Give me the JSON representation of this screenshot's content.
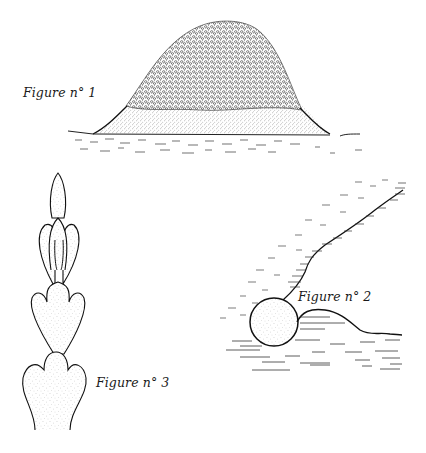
{
  "figures": [
    {
      "id": "fig1",
      "label": "Figure n° 1",
      "subject": "mound"
    },
    {
      "id": "fig2",
      "label": "Figure n° 2",
      "subject": "boulder-on-slope"
    },
    {
      "id": "fig3",
      "label": "Figure n° 3",
      "subject": "stacked-lobes"
    }
  ],
  "colors": {
    "ink": "#1a1a1a",
    "paper": "#ffffff",
    "stipple": "#555555"
  }
}
